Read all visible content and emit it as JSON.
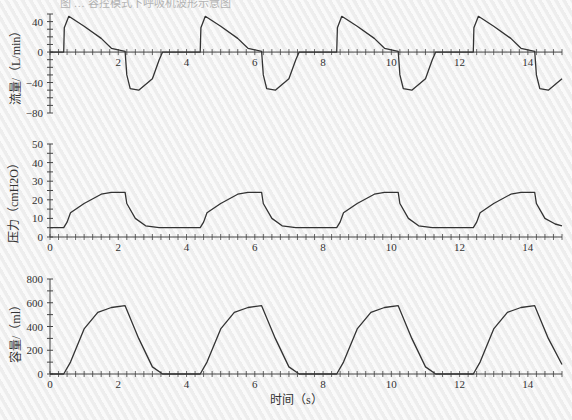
{
  "figure": {
    "caption_partial": "图 … 容控模式下呼吸机波形示意图",
    "xlabel": "时间（s）"
  },
  "chart_data": [
    {
      "type": "line",
      "title": "",
      "ylabel": "流量/（L/min）",
      "xlabel": "",
      "xlim": [
        0,
        15
      ],
      "ylim": [
        -80,
        50
      ],
      "yticks": [
        -80,
        -40,
        0,
        40
      ],
      "xticks": [
        2,
        4,
        6,
        8,
        10,
        12,
        14
      ],
      "grid": false,
      "series": [
        {
          "name": "flow",
          "x": [
            0,
            0.4,
            0.42,
            0.55,
            1.0,
            1.5,
            1.8,
            2.2,
            2.25,
            2.35,
            2.6,
            3.0,
            3.2,
            3.3,
            4.4,
            4.42,
            4.55,
            5.0,
            5.5,
            5.8,
            6.2,
            6.25,
            6.35,
            6.6,
            7.0,
            7.2,
            7.3,
            8.4,
            8.42,
            8.55,
            9.0,
            9.5,
            9.8,
            10.2,
            10.25,
            10.35,
            10.6,
            11.0,
            11.2,
            11.3,
            12.4,
            12.42,
            12.55,
            13.0,
            13.5,
            13.8,
            14.2,
            14.25,
            14.35,
            14.6,
            15.0
          ],
          "values": [
            0,
            0,
            32,
            47,
            34,
            18,
            5,
            1,
            -30,
            -48,
            -50,
            -35,
            -10,
            0,
            0,
            32,
            47,
            34,
            18,
            5,
            1,
            -30,
            -48,
            -50,
            -35,
            -10,
            0,
            0,
            32,
            47,
            34,
            18,
            5,
            1,
            -30,
            -48,
            -50,
            -35,
            -10,
            0,
            0,
            32,
            47,
            34,
            18,
            5,
            1,
            -30,
            -48,
            -50,
            -35
          ]
        }
      ]
    },
    {
      "type": "line",
      "title": "",
      "ylabel": "压力（cmH2O）",
      "xlabel": "",
      "xlim": [
        0,
        15
      ],
      "ylim": [
        0,
        50
      ],
      "yticks": [
        0,
        10,
        20,
        30,
        40,
        50
      ],
      "xticks": [
        0,
        2,
        4,
        6,
        8,
        10,
        12,
        14
      ],
      "grid": false,
      "series": [
        {
          "name": "pressure",
          "x": [
            0,
            0.4,
            0.5,
            0.6,
            1.0,
            1.5,
            1.8,
            2.2,
            2.25,
            2.5,
            2.8,
            3.2,
            4.4,
            4.5,
            4.6,
            5.0,
            5.5,
            5.8,
            6.2,
            6.25,
            6.5,
            6.8,
            7.2,
            8.4,
            8.5,
            8.6,
            9.0,
            9.5,
            9.8,
            10.2,
            10.25,
            10.5,
            10.8,
            11.2,
            12.4,
            12.5,
            12.6,
            13.0,
            13.5,
            13.8,
            14.2,
            14.25,
            14.5,
            14.8,
            15.0
          ],
          "values": [
            5,
            5,
            8,
            13,
            18,
            23,
            24,
            24,
            18,
            10,
            6,
            5,
            5,
            8,
            13,
            18,
            23,
            24,
            24,
            18,
            10,
            6,
            5,
            5,
            8,
            13,
            18,
            23,
            24,
            24,
            18,
            10,
            6,
            5,
            5,
            8,
            13,
            18,
            23,
            24,
            24,
            18,
            10,
            7,
            6
          ]
        }
      ]
    },
    {
      "type": "line",
      "title": "",
      "ylabel": "容量/（ml）",
      "xlabel": "时间（s）",
      "xlim": [
        0,
        15
      ],
      "ylim": [
        0,
        800
      ],
      "yticks": [
        0,
        200,
        400,
        600,
        800
      ],
      "xticks": [
        0,
        2,
        4,
        6,
        8,
        10,
        12,
        14
      ],
      "grid": false,
      "series": [
        {
          "name": "volume",
          "x": [
            0,
            0.4,
            0.6,
            1.0,
            1.4,
            1.8,
            2.2,
            2.6,
            3.0,
            3.3,
            4.4,
            4.6,
            5.0,
            5.4,
            5.8,
            6.2,
            6.6,
            7.0,
            7.3,
            8.4,
            8.6,
            9.0,
            9.4,
            9.8,
            10.2,
            10.6,
            11.0,
            11.3,
            12.4,
            12.6,
            13.0,
            13.4,
            13.8,
            14.2,
            14.6,
            15.0
          ],
          "values": [
            0,
            0,
            100,
            380,
            520,
            560,
            575,
            300,
            60,
            0,
            0,
            100,
            380,
            520,
            560,
            575,
            300,
            60,
            0,
            0,
            100,
            380,
            520,
            560,
            575,
            300,
            60,
            0,
            0,
            100,
            380,
            520,
            560,
            575,
            300,
            80
          ]
        }
      ]
    }
  ],
  "colors": {
    "line": "#333333",
    "axis": "#444444",
    "background": "#f4f4f4"
  }
}
